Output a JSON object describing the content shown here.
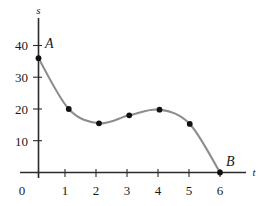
{
  "chart_data": {
    "type": "line",
    "title": "",
    "subtitle": "",
    "xlabel": "t",
    "ylabel": "s",
    "xlim": [
      0,
      6.6
    ],
    "ylim": [
      0,
      45
    ],
    "xticks": [
      "0",
      "1",
      "2",
      "3",
      "4",
      "5",
      "6"
    ],
    "xtick_values": [
      0,
      1,
      2,
      3,
      4,
      5,
      6
    ],
    "yticks": [
      "0",
      "10",
      "20",
      "30",
      "40"
    ],
    "ytick_values": [
      0,
      10,
      20,
      30,
      40
    ],
    "grid": false,
    "legend": null,
    "curve_color": "#8c8c8c",
    "point_color": "#111111",
    "axis_color": "#2b2b2b",
    "x": [
      0,
      1,
      2,
      3,
      4,
      5,
      6
    ],
    "values": [
      36,
      20,
      15.5,
      18,
      19.8,
      15.3,
      0
    ],
    "series": [
      {
        "name": "s(t)",
        "values": [
          36,
          20,
          15.5,
          18,
          19.8,
          15.3,
          0
        ]
      }
    ],
    "annotations": [
      {
        "label": "A",
        "x": 0,
        "y": 36
      },
      {
        "label": "B",
        "x": 6,
        "y": 0
      }
    ]
  },
  "axis": {
    "y_name": "s",
    "x_name": "t"
  },
  "labels": {
    "point_a": "A",
    "point_b": "B"
  },
  "xticks": {
    "t0": "0",
    "t1": "1",
    "t2": "2",
    "t3": "3",
    "t4": "4",
    "t5": "5",
    "t6": "6"
  },
  "yticks": {
    "v10": "10",
    "v20": "20",
    "v30": "30",
    "v40": "40"
  }
}
